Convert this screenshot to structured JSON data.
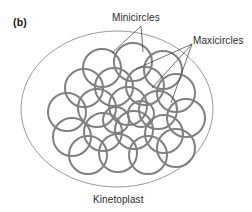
{
  "figure": {
    "panel_letter": "(b)",
    "labels": {
      "minicircles": "Minicircles",
      "maxicircles": "Maxicircles",
      "kinetoplast": "Kinetoplast"
    },
    "colors": {
      "circle_stroke": "#808080",
      "envelope_stroke": "#9a9a9a",
      "leader_stroke": "#4d4d4d",
      "text": "#2b2b2b",
      "background": "#ffffff"
    },
    "envelope": {
      "shape": "ellipse",
      "cx": 117,
      "cy": 109,
      "rx": 96,
      "ry": 78,
      "stroke_width": 1
    },
    "network": {
      "description": "interlocked catenated DNA minicircle network with larger maxicircles",
      "circle_stroke_width": 2,
      "circles": [
        {
          "cx": 102,
          "cy": 68,
          "r": 19
        },
        {
          "cx": 133,
          "cy": 62,
          "r": 19
        },
        {
          "cx": 163,
          "cy": 70,
          "r": 19
        },
        {
          "cx": 84,
          "cy": 88,
          "r": 19
        },
        {
          "cx": 114,
          "cy": 87,
          "r": 19
        },
        {
          "cx": 145,
          "cy": 86,
          "r": 19
        },
        {
          "cx": 176,
          "cy": 93,
          "r": 19
        },
        {
          "cx": 67,
          "cy": 112,
          "r": 19
        },
        {
          "cx": 97,
          "cy": 108,
          "r": 19
        },
        {
          "cx": 128,
          "cy": 106,
          "r": 19
        },
        {
          "cx": 158,
          "cy": 110,
          "r": 19
        },
        {
          "cx": 186,
          "cy": 118,
          "r": 19
        },
        {
          "cx": 72,
          "cy": 137,
          "r": 19
        },
        {
          "cx": 103,
          "cy": 132,
          "r": 19
        },
        {
          "cx": 134,
          "cy": 130,
          "r": 19
        },
        {
          "cx": 164,
          "cy": 134,
          "r": 19
        },
        {
          "cx": 88,
          "cy": 155,
          "r": 19
        },
        {
          "cx": 118,
          "cy": 153,
          "r": 19
        },
        {
          "cx": 148,
          "cy": 155,
          "r": 19
        },
        {
          "cx": 176,
          "cy": 148,
          "r": 19
        },
        {
          "cx": 116,
          "cy": 120,
          "r": 13
        },
        {
          "cx": 141,
          "cy": 114,
          "r": 13
        }
      ]
    },
    "leaders": {
      "minicircles": {
        "apex": {
          "x": 141,
          "y": 26
        },
        "targets": [
          {
            "x": 112,
            "y": 53
          },
          {
            "x": 143,
            "y": 52
          }
        ]
      },
      "maxicircles": {
        "apex": {
          "x": 192,
          "y": 44
        },
        "targets": [
          {
            "x": 136,
            "y": 69
          },
          {
            "x": 152,
            "y": 88
          },
          {
            "x": 171,
            "y": 103
          }
        ]
      }
    }
  }
}
